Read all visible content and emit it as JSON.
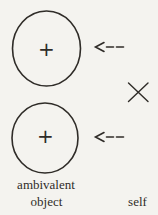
{
  "figure": {
    "colors": {
      "paper": "#f4f3ef",
      "ink": "#2f2c28"
    },
    "top_circle": {
      "sign": "+"
    },
    "bottom_circle": {
      "sign": "+"
    },
    "labels": {
      "object_line1": "ambivalent",
      "object_line2": "object",
      "self": "self"
    }
  }
}
